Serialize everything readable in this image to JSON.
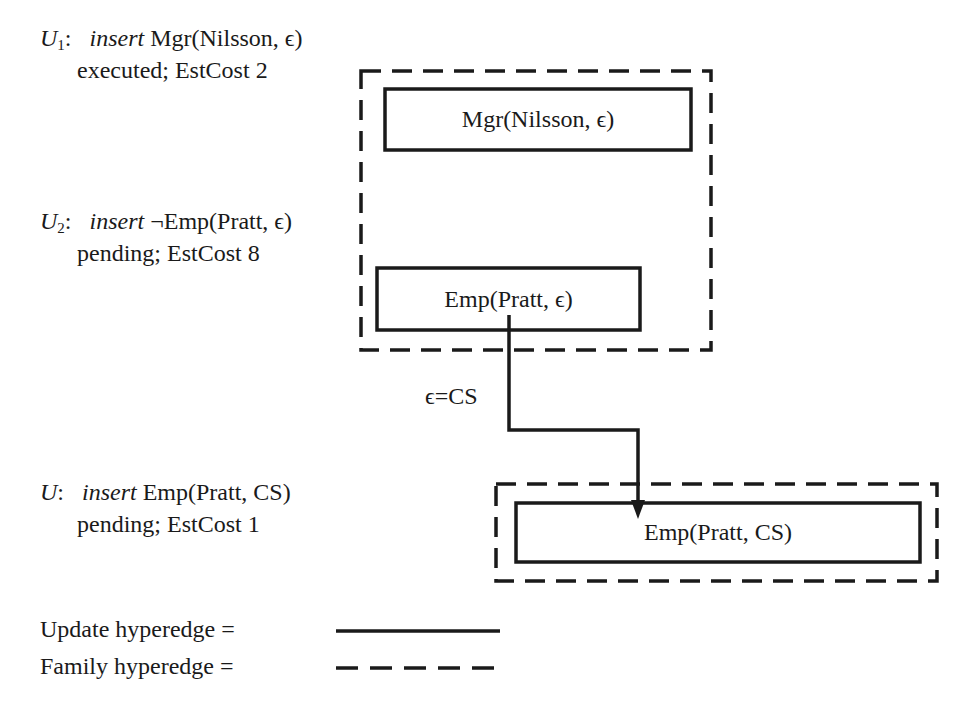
{
  "updates": [
    {
      "id": "U1",
      "name": "U",
      "subscript": "1",
      "colon": ":",
      "op": "insert",
      "literal": "Mgr(Nilsson, ϵ)",
      "status": "executed; EstCost 2"
    },
    {
      "id": "U2",
      "name": "U",
      "subscript": "2",
      "colon": ":",
      "op": "insert",
      "literal": "¬Emp(Pratt, ϵ)",
      "status": "pending; EstCost 8"
    },
    {
      "id": "U",
      "name": "U",
      "subscript": "",
      "colon": ":",
      "op": "insert",
      "literal": "Emp(Pratt, CS)",
      "status": "pending; EstCost 1"
    }
  ],
  "nodes": {
    "mgr_nilsson": "Mgr(Nilsson, ϵ)",
    "emp_pratt_eps": "Emp(Pratt, ϵ)",
    "emp_pratt_cs": "Emp(Pratt, CS)"
  },
  "edge_label": "ϵ=CS",
  "legend": {
    "update": "Update hyperedge =",
    "family": "Family hyperedge ="
  },
  "colors": {
    "ink": "#1a1a1a",
    "background": "#ffffff"
  }
}
